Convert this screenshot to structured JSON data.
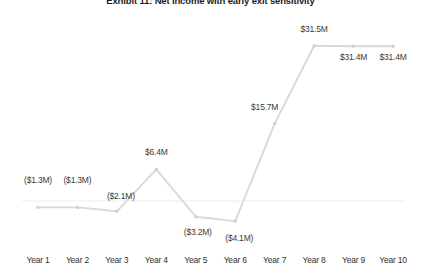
{
  "chart_data": {
    "type": "line",
    "title": "Exhibit 11: Net Income with early exit sensitivity",
    "xlabel": "",
    "ylabel": "",
    "grid": false,
    "legend": false,
    "zero_line": true,
    "categories": [
      "Year 1",
      "Year 2",
      "Year 3",
      "Year 4",
      "Year 5",
      "Year 6",
      "Year 7",
      "Year 8",
      "Year 9",
      "Year 10"
    ],
    "values": [
      -1.3,
      -1.3,
      -2.1,
      6.4,
      -3.2,
      -4.1,
      15.7,
      31.5,
      31.4,
      31.4
    ],
    "units": "$M",
    "data_labels": [
      "($1.3M)",
      "($1.3M)",
      "($2.1M)",
      "$6.4M",
      "($3.2M)",
      "($4.1M)",
      "$15.7M",
      "$31.5M",
      "$31.4M",
      "$31.4M"
    ],
    "ylim": [
      -6.5,
      34.5
    ],
    "series": [
      {
        "name": "Net Income",
        "values": [
          -1.3,
          -1.3,
          -2.1,
          6.4,
          -3.2,
          -4.1,
          15.7,
          31.5,
          31.4,
          31.4
        ]
      }
    ],
    "colors": {
      "line": "#d9d9d9",
      "marker": "#d0d0d0",
      "zero_line": "#ededed",
      "label_text": "#3a3a3a",
      "tick_text": "#2f2f2f",
      "title_text": "#1d1d1d",
      "background": "#ffffff"
    }
  }
}
